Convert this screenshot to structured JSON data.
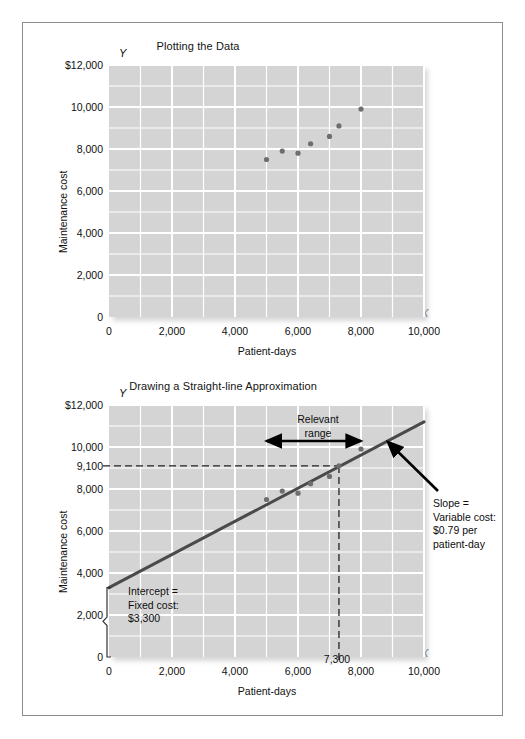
{
  "figures": [
    {
      "id": "plotting-the-data",
      "title": "Plotting the Data",
      "x_axis_letter": "X",
      "y_axis_letter": "Y",
      "xlabel": "Patient-days",
      "ylabel": "Maintenance cost",
      "yticks": [
        "$12,000",
        "10,000",
        "8,000",
        "6,000",
        "4,000",
        "2,000",
        "0"
      ],
      "xticks": [
        "0",
        "2,000",
        "4,000",
        "6,000",
        "8,000",
        "10,000"
      ]
    },
    {
      "id": "straight-line-approximation",
      "title": "Drawing a Straight-line Approximation",
      "x_axis_letter": "X",
      "y_axis_letter": "Y",
      "xlabel": "Patient-days",
      "ylabel": "Maintenance cost",
      "yticks": [
        "$12,000",
        "10,000",
        "8,000",
        "6,000",
        "4,000",
        "2,000",
        "0"
      ],
      "ytick_extra": "9,100",
      "xticks": [
        "0",
        "2,000",
        "4,000",
        "6,000",
        "8,000",
        "10,000"
      ],
      "xtick_extra": "7,300",
      "annotations": {
        "relevant_range": "Relevant\nrange",
        "slope": "Slope =\nVariable cost:\n$0.79 per\npatient-day",
        "intercept": "Intercept =\nFixed cost:\n$3,300"
      }
    }
  ],
  "chart_data": [
    {
      "type": "scatter",
      "title": "Plotting the Data",
      "xlabel": "Patient-days",
      "ylabel": "Maintenance cost",
      "xlim": [
        0,
        10000
      ],
      "ylim": [
        0,
        12000
      ],
      "xticks": [
        0,
        2000,
        4000,
        6000,
        8000,
        10000
      ],
      "yticks": [
        0,
        2000,
        4000,
        6000,
        8000,
        10000,
        12000
      ],
      "grid": true,
      "grid_step_x": 1000,
      "grid_step_y": 1000,
      "legend": "none",
      "points": [
        {
          "x": 5000,
          "y": 7500
        },
        {
          "x": 5500,
          "y": 7900
        },
        {
          "x": 6000,
          "y": 7800
        },
        {
          "x": 6400,
          "y": 8250
        },
        {
          "x": 7000,
          "y": 8600
        },
        {
          "x": 7300,
          "y": 9100
        },
        {
          "x": 8000,
          "y": 9900
        }
      ]
    },
    {
      "type": "scatter",
      "title": "Drawing a Straight-line Approximation",
      "xlabel": "Patient-days",
      "ylabel": "Maintenance cost",
      "xlim": [
        0,
        10000
      ],
      "ylim": [
        0,
        12000
      ],
      "xticks": [
        0,
        2000,
        4000,
        6000,
        8000,
        10000
      ],
      "yticks": [
        0,
        2000,
        4000,
        6000,
        8000,
        10000,
        12000
      ],
      "grid": true,
      "grid_step_x": 1000,
      "grid_step_y": 1000,
      "legend": "none",
      "points": [
        {
          "x": 5000,
          "y": 7500
        },
        {
          "x": 5500,
          "y": 7900
        },
        {
          "x": 6000,
          "y": 7800
        },
        {
          "x": 6400,
          "y": 8250
        },
        {
          "x": 7000,
          "y": 8600
        },
        {
          "x": 7300,
          "y": 9100
        },
        {
          "x": 8000,
          "y": 9900
        }
      ],
      "trendline": {
        "intercept": 3300,
        "slope": 0.79,
        "x_from": 0,
        "x_to": 10000,
        "label": "Slope = Variable cost: $0.79 per patient-day"
      },
      "reference_lines": [
        {
          "axis": "y",
          "value": 9100,
          "label": "9,100",
          "style": "dashed"
        },
        {
          "axis": "x",
          "value": 7300,
          "label": "7,300",
          "style": "dashed"
        }
      ],
      "relevant_range": {
        "from": 5000,
        "to": 8000,
        "label": "Relevant range"
      }
    }
  ],
  "colors": {
    "plot_background": "#d4d4d4",
    "gridline": "#ffffff",
    "point": "#6e6e6e",
    "trendline": "#4a4a4a",
    "text": "#101010",
    "frame": "#8b8b8f"
  }
}
